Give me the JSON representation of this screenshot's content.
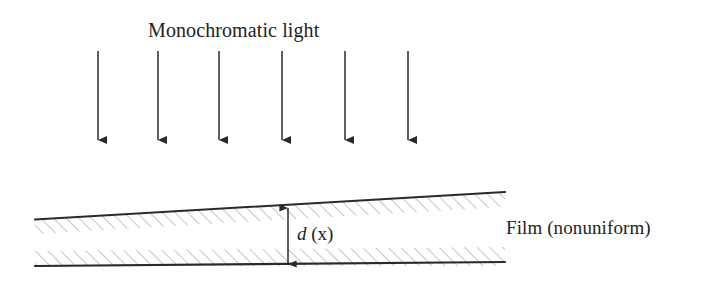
{
  "figure": {
    "title": "Monochromatic light",
    "film_label": "Film (nonuniform)",
    "thickness_label_var": "d",
    "thickness_label_arg": "(x)",
    "colors": {
      "ink": "#231f20",
      "line": "#2a2a2a",
      "hatch": "#9a9a9a",
      "background": "#ffffff"
    },
    "beam": {
      "name": "incident-light-rays",
      "count": 6,
      "direction": "downward",
      "top_y": 51,
      "tip_y": 148,
      "x_positions": [
        98,
        158,
        219,
        282,
        345,
        408
      ]
    },
    "film": {
      "shape": "wedge",
      "left_x": 35,
      "right_x": 505,
      "top_left_y": 219,
      "top_right_y": 192,
      "bottom_left_y": 266,
      "bottom_right_y": 262,
      "hatch_band_thickness": 15,
      "hatch_angle_deg": 45
    },
    "thickness_arrow": {
      "name": "thickness-dimension-arrow",
      "x": 288,
      "top_y": 208,
      "bottom_y": 264,
      "heads": "both"
    }
  }
}
